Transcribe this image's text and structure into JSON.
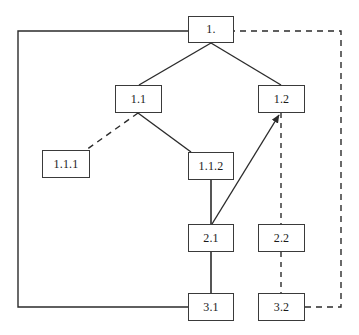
{
  "diagram": {
    "type": "node-link-graph",
    "canvas": {
      "width": 359,
      "height": 335,
      "background": "#ffffff"
    },
    "colors": {
      "node_border": "#3a3a3a",
      "node_fill": "#ffffff",
      "edge_solid": "#2b2b2b",
      "edge_dashed": "#2b2b2b",
      "label_text": "#1a1a1a"
    },
    "nodes": [
      {
        "id": "n1",
        "label": "1.",
        "x": 188,
        "y": 16,
        "w": 46,
        "h": 27
      },
      {
        "id": "n11",
        "label": "1.1",
        "x": 115,
        "y": 85,
        "w": 47,
        "h": 28
      },
      {
        "id": "n12",
        "label": "1.2",
        "x": 258,
        "y": 85,
        "w": 47,
        "h": 28
      },
      {
        "id": "n111",
        "label": "1.1.1",
        "x": 42,
        "y": 150,
        "w": 48,
        "h": 28
      },
      {
        "id": "n112",
        "label": "1.1.2",
        "x": 188,
        "y": 152,
        "w": 46,
        "h": 28
      },
      {
        "id": "n21",
        "label": "2.1",
        "x": 188,
        "y": 224,
        "w": 46,
        "h": 28
      },
      {
        "id": "n22",
        "label": "2.2",
        "x": 258,
        "y": 224,
        "w": 47,
        "h": 28
      },
      {
        "id": "n31",
        "label": "3.1",
        "x": 188,
        "y": 293,
        "w": 46,
        "h": 28
      },
      {
        "id": "n32",
        "label": "3.2",
        "x": 258,
        "y": 293,
        "w": 47,
        "h": 28
      }
    ],
    "edges": [
      {
        "id": "e-1-11",
        "from": "n1",
        "to": "n11",
        "style": "solid",
        "arrow": "none"
      },
      {
        "id": "e-1-12",
        "from": "n1",
        "to": "n12",
        "style": "solid",
        "arrow": "none"
      },
      {
        "id": "e-11-111",
        "from": "n11",
        "to": "n111",
        "style": "dashed",
        "arrow": "none"
      },
      {
        "id": "e-11-112",
        "from": "n11",
        "to": "n112",
        "style": "solid",
        "arrow": "none"
      },
      {
        "id": "e-112-21",
        "from": "n112",
        "to": "n21",
        "style": "solid",
        "arrow": "none"
      },
      {
        "id": "e-21-12",
        "from": "n21",
        "to": "n12",
        "style": "solid",
        "arrow": "up"
      },
      {
        "id": "e-21-31",
        "from": "n21",
        "to": "n31",
        "style": "solid",
        "arrow": "none"
      },
      {
        "id": "e-12-22",
        "from": "n12",
        "to": "n22",
        "style": "dashed",
        "arrow": "none"
      },
      {
        "id": "e-22-32",
        "from": "n22",
        "to": "n32",
        "style": "dashed",
        "arrow": "none"
      },
      {
        "id": "e-31-1",
        "from": "n31",
        "to": "n1",
        "style": "solid",
        "arrow": "none",
        "route": "left-orthogonal"
      },
      {
        "id": "e-32-1",
        "from": "n32",
        "to": "n1",
        "style": "dashed",
        "arrow": "none",
        "route": "right-orthogonal"
      }
    ]
  }
}
